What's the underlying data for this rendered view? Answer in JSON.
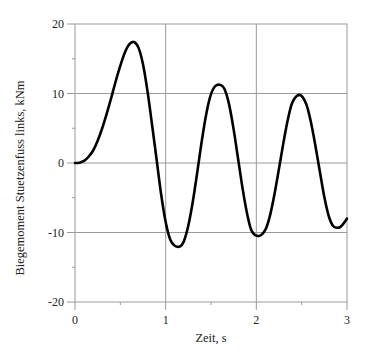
{
  "chart_data": {
    "type": "line",
    "title": "",
    "xlabel": "Zeit, s",
    "ylabel": "Biegemoment Stuetzenfuss links, kNm",
    "xlim": [
      0,
      3
    ],
    "ylim": [
      -20,
      20
    ],
    "xticks": [
      0,
      1,
      2,
      3
    ],
    "xtick_labels": [
      "0",
      "1",
      "2",
      "3"
    ],
    "yticks": [
      20,
      10,
      0,
      -10,
      -20
    ],
    "ytick_labels": [
      "20",
      "10",
      "0",
      "-10",
      "-20"
    ],
    "grid": true,
    "legend": null,
    "series": [
      {
        "name": "Biegemoment",
        "color": "#000000",
        "x": [
          0.0,
          0.05,
          0.1,
          0.15,
          0.2,
          0.25,
          0.3,
          0.35,
          0.4,
          0.45,
          0.5,
          0.55,
          0.6,
          0.65,
          0.7,
          0.75,
          0.8,
          0.85,
          0.9,
          0.95,
          1.0,
          1.05,
          1.1,
          1.16,
          1.2,
          1.25,
          1.3,
          1.35,
          1.4,
          1.45,
          1.5,
          1.55,
          1.61,
          1.65,
          1.7,
          1.75,
          1.8,
          1.85,
          1.9,
          1.95,
          2.03,
          2.1,
          2.15,
          2.2,
          2.25,
          2.3,
          2.35,
          2.4,
          2.48,
          2.55,
          2.6,
          2.65,
          2.7,
          2.75,
          2.8,
          2.85,
          2.91,
          2.95,
          3.0
        ],
        "y": [
          0.0,
          0.05,
          0.3,
          0.9,
          1.8,
          3.2,
          5.0,
          7.1,
          9.4,
          11.8,
          14.0,
          15.9,
          17.1,
          17.4,
          16.6,
          14.2,
          10.3,
          5.5,
          0.5,
          -4.5,
          -8.5,
          -11.0,
          -11.9,
          -12.0,
          -11.3,
          -9.0,
          -5.5,
          -1.2,
          3.3,
          7.2,
          9.9,
          11.1,
          11.2,
          10.6,
          8.4,
          4.8,
          0.5,
          -3.8,
          -7.4,
          -9.8,
          -10.5,
          -9.6,
          -7.6,
          -4.5,
          -0.8,
          3.0,
          6.4,
          8.8,
          9.8,
          8.5,
          6.0,
          2.6,
          -1.2,
          -4.9,
          -7.7,
          -9.1,
          -9.3,
          -8.9,
          -8.0
        ]
      }
    ]
  }
}
